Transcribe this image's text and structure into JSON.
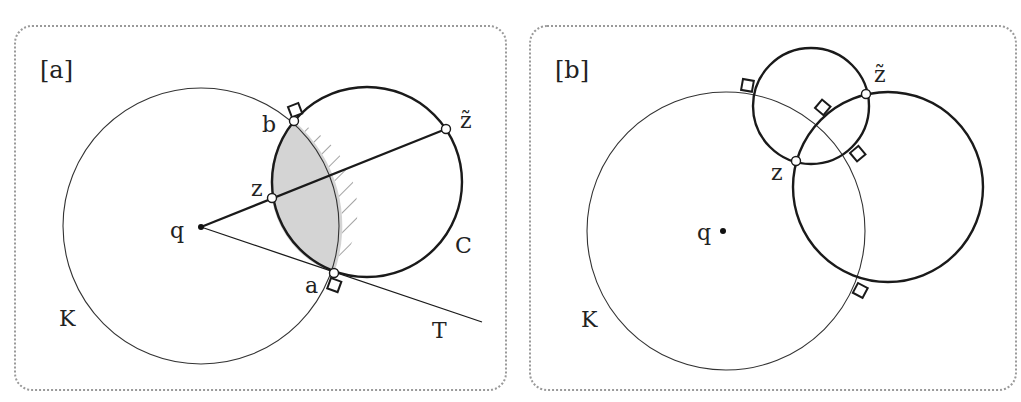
{
  "panels": [
    {
      "id": "a",
      "label": "[a]",
      "labels": {
        "K": "K",
        "q": "q",
        "b": "b",
        "z": "z",
        "z_tilde": "z̃",
        "a": "a",
        "C": "C",
        "T": "T"
      },
      "geometry": {
        "circle_K": {
          "cx": 201,
          "cy": 226,
          "r": 138
        },
        "circle_C": {
          "cx": 367,
          "cy": 182,
          "r": 95
        },
        "q": [
          201,
          227
        ],
        "b": [
          294,
          121
        ],
        "a": [
          334,
          273
        ],
        "z": [
          272,
          198
        ],
        "z_tilde": [
          446,
          129
        ],
        "T_end": [
          482,
          322
        ]
      },
      "styles": {
        "lens_fill": "#d4d4d4",
        "hatch_color": "#555555"
      }
    },
    {
      "id": "b",
      "label": "[b]",
      "labels": {
        "K": "K",
        "q": "q",
        "z": "z",
        "z_tilde": "z̃"
      },
      "geometry": {
        "circle_K": {
          "cx": 726,
          "cy": 231,
          "r": 139
        },
        "circle_small": {
          "cx": 811,
          "cy": 106,
          "r": 58
        },
        "circle_big": {
          "cx": 888,
          "cy": 187,
          "r": 95
        },
        "q": [
          723,
          231
        ],
        "z": [
          796,
          161
        ],
        "z_tilde": [
          866,
          94
        ]
      }
    }
  ]
}
